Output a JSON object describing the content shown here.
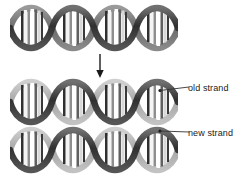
{
  "figure": {
    "background_color": "#ffffff",
    "width": 249,
    "height": 183
  },
  "diagram": {
    "type": "biology-illustration",
    "process": "DNA replication",
    "structures": [
      {
        "name": "parent-double-helix",
        "role": "original DNA molecule before replication",
        "turns": 4,
        "strand_colors": [
          "#4d4d4d",
          "#808080"
        ],
        "base_pair_colors": [
          "#ffffff",
          "#b3b3b3",
          "#666666",
          "#2b2b2b"
        ]
      },
      {
        "name": "daughter-double-helix-1",
        "role": "first replicated DNA molecule",
        "turns": 4,
        "strand_colors": [
          "#4d4d4d",
          "#b0b0b0"
        ],
        "base_pair_colors": [
          "#ffffff",
          "#b3b3b3",
          "#666666",
          "#2b2b2b"
        ]
      },
      {
        "name": "daughter-double-helix-2",
        "role": "second replicated DNA molecule",
        "turns": 4,
        "strand_colors": [
          "#4d4d4d",
          "#b0b0b0"
        ],
        "base_pair_colors": [
          "#ffffff",
          "#b3b3b3",
          "#666666",
          "#2b2b2b"
        ]
      }
    ],
    "arrow": {
      "name": "replication-arrow",
      "direction": "down",
      "color": "#1a1a1a"
    }
  },
  "labels": {
    "old_strand": "old strand",
    "new_strand": "new strand",
    "text_color": "#1a1a1a",
    "leader_color": "#333333"
  }
}
